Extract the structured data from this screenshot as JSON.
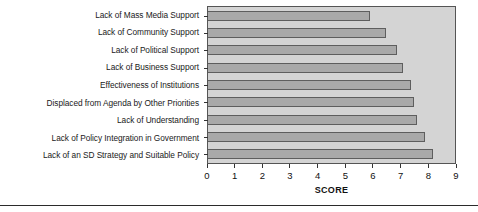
{
  "chart_data": {
    "type": "bar",
    "orientation": "horizontal",
    "title": "",
    "xlabel": "SCORE",
    "ylabel": "",
    "xlim": [
      0,
      9
    ],
    "ylim": null,
    "grid": false,
    "legend": null,
    "xticks": [
      "0",
      "1",
      "2",
      "3",
      "4",
      "5",
      "6",
      "7",
      "8",
      "9"
    ],
    "categories": [
      "Lack of Mass Media Support",
      "Lack of Community Support",
      "Lack of Political Support",
      "Lack of Business Support",
      "Effectiveness of Institutions",
      "Displaced from Agenda by Other Priorities",
      "Lack of Understanding",
      "Lack of Policy Integration in Government",
      "Lack of an SD Strategy and Suitable Policy"
    ],
    "values": [
      5.9,
      6.5,
      6.9,
      7.1,
      7.4,
      7.5,
      7.6,
      7.9,
      8.2
    ],
    "colors": {
      "bar_fill": "#a9a9a9",
      "bar_edge": "#5e5e5e",
      "plot_background": "#d4d4d4",
      "axis": "#333333",
      "text": "#111111",
      "figure_background": "#ffffff"
    }
  }
}
